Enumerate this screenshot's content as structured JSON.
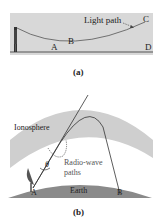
{
  "panel_a": {
    "caption": "(a)",
    "labels": {
      "light_path": "Light path",
      "A": "A",
      "B": "B",
      "C": "C",
      "D": "D"
    },
    "colors": {
      "background": "#d8d8d8",
      "ground": "#555555",
      "path": "#555555"
    }
  },
  "panel_b": {
    "caption": "(b)",
    "labels": {
      "ionosphere": "Ionosphere",
      "radio_wave": "Radio-wave",
      "paths": "paths",
      "theta": "θ",
      "earth": "Earth",
      "A": "A",
      "B": "B"
    },
    "colors": {
      "ionosphere": "#cfcfcf",
      "earth": "#8a8a8a",
      "path": "#333333"
    }
  }
}
